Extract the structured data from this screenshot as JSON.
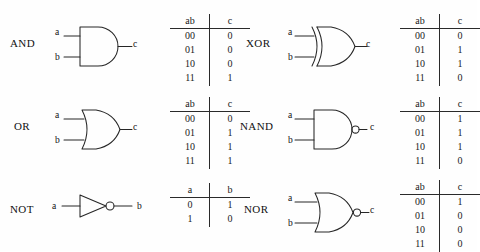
{
  "figure": {
    "background_color": "#fefefe",
    "ink_color": "#262626"
  },
  "gates": [
    {
      "id": "and",
      "name": "AND",
      "symbol": "and-gate-symbol",
      "inputs": [
        "a",
        "b"
      ],
      "output": "c",
      "inverted": false,
      "table": {
        "headers": [
          "ab",
          "c"
        ],
        "rows": [
          [
            "00",
            "0"
          ],
          [
            "01",
            "0"
          ],
          [
            "10",
            "0"
          ],
          [
            "11",
            "1"
          ]
        ]
      }
    },
    {
      "id": "xor",
      "name": "XOR",
      "symbol": "xor-gate-symbol",
      "inputs": [
        "a",
        "b"
      ],
      "output": "c",
      "inverted": false,
      "table": {
        "headers": [
          "ab",
          "c"
        ],
        "rows": [
          [
            "00",
            "0"
          ],
          [
            "01",
            "1"
          ],
          [
            "10",
            "1"
          ],
          [
            "11",
            "0"
          ]
        ]
      }
    },
    {
      "id": "or",
      "name": "OR",
      "symbol": "or-gate-symbol",
      "inputs": [
        "a",
        "b"
      ],
      "output": "c",
      "inverted": false,
      "table": {
        "headers": [
          "ab",
          "c"
        ],
        "rows": [
          [
            "00",
            "0"
          ],
          [
            "01",
            "1"
          ],
          [
            "10",
            "1"
          ],
          [
            "11",
            "1"
          ]
        ]
      }
    },
    {
      "id": "nand",
      "name": "NAND",
      "symbol": "nand-gate-symbol",
      "inputs": [
        "a",
        "b"
      ],
      "output": "c",
      "inverted": true,
      "table": {
        "headers": [
          "ab",
          "c"
        ],
        "rows": [
          [
            "00",
            "1"
          ],
          [
            "01",
            "1"
          ],
          [
            "10",
            "1"
          ],
          [
            "11",
            "0"
          ]
        ]
      }
    },
    {
      "id": "not",
      "name": "NOT",
      "symbol": "not-gate-symbol",
      "inputs": [
        "a"
      ],
      "output": "b",
      "inverted": true,
      "table": {
        "headers": [
          "a",
          "b"
        ],
        "rows": [
          [
            "0",
            "1"
          ],
          [
            "1",
            "0"
          ]
        ]
      }
    },
    {
      "id": "nor",
      "name": "NOR",
      "symbol": "nor-gate-symbol",
      "inputs": [
        "a",
        "b"
      ],
      "output": "c",
      "inverted": true,
      "table": {
        "headers": [
          "ab",
          "c"
        ],
        "rows": [
          [
            "00",
            "1"
          ],
          [
            "01",
            "0"
          ],
          [
            "10",
            "0"
          ],
          [
            "11",
            "0"
          ]
        ]
      }
    }
  ]
}
